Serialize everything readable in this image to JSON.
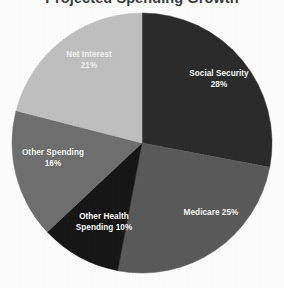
{
  "chart_data": {
    "type": "pie",
    "title": "Projected Spending Growth",
    "xlabel": "",
    "ylabel": "",
    "legend": "none",
    "grid": false,
    "start_angle_deg": 0,
    "direction": "clockwise",
    "units": "percent",
    "total": 100,
    "categories": [
      "Social Security",
      "Medicare",
      "Other Health Spending",
      "Other Spending",
      "Net Interest"
    ],
    "values": [
      28,
      25,
      10,
      16,
      21
    ],
    "slices": [
      {
        "name": "Social Security",
        "value": 28,
        "label": "Social Security\n28%",
        "percent_text": "28%",
        "color": "#2a2a2a",
        "label_color": "#ffffff"
      },
      {
        "name": "Medicare",
        "value": 25,
        "label": "Medicare 25%",
        "percent_text": "25%",
        "color": "#595959",
        "label_color": "#ffffff"
      },
      {
        "name": "Other Health Spending",
        "value": 10,
        "label": "Other Health\nSpending 10%",
        "percent_text": "10%",
        "color": "#151515",
        "label_color": "#ffffff"
      },
      {
        "name": "Other Spending",
        "value": 16,
        "label": "Other Spending\n16%",
        "percent_text": "16%",
        "color": "#6e6e6e",
        "label_color": "#ffffff"
      },
      {
        "name": "Net Interest",
        "value": 21,
        "label": "Net Interest\n21%",
        "percent_text": "21%",
        "color": "#bfbfbf",
        "label_color": "#f2f2f2"
      }
    ],
    "geometry": {
      "center_x": 142,
      "center_y": 143,
      "radius": 130
    },
    "background_color": "#fdfdfd",
    "title_color": "#3a3a3a"
  }
}
